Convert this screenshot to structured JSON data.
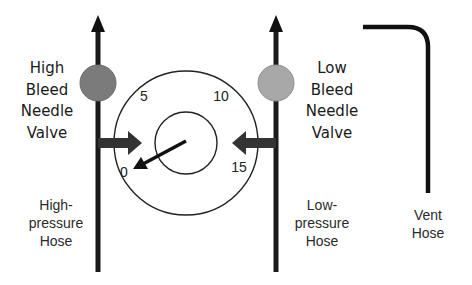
{
  "diagram": {
    "labels": {
      "high_valve": [
        "High",
        "Bleed",
        "Needle",
        "Valve"
      ],
      "low_valve": [
        "Low",
        "Bleed",
        "Needle",
        "Valve"
      ],
      "high_hose": [
        "High-",
        "pressure",
        "Hose"
      ],
      "low_hose": [
        "Low-",
        "pressure",
        "Hose"
      ],
      "vent_hose": [
        "Vent",
        "Hose"
      ]
    },
    "gauge": {
      "ticks": [
        "0",
        "5",
        "10",
        "15"
      ],
      "needle_value": "0"
    },
    "colors": {
      "line": "#1a1a1a",
      "high_valve_fill": "#7b7b7b",
      "low_valve_fill": "#a8a8a8",
      "arrow": "#333333"
    }
  }
}
